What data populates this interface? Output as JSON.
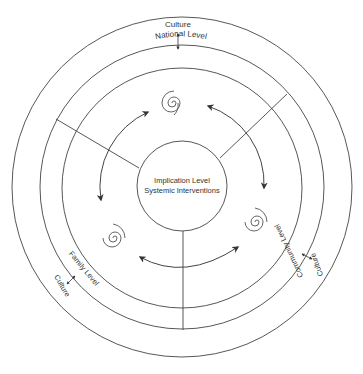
{
  "diagram": {
    "center": {
      "line1": "Implication Level",
      "line2": "Systemic Interventions"
    },
    "levels": {
      "national": "National Level",
      "family": "Family Level",
      "community": "Community Level"
    },
    "culture_labels": {
      "top": "Culture",
      "left": "Culture",
      "right": "Culture"
    },
    "colors": {
      "stroke": "#444444",
      "text": "#333333",
      "background": "#ffffff"
    }
  }
}
